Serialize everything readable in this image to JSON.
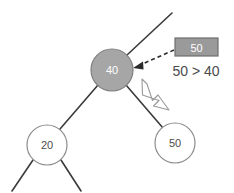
{
  "diagram": {
    "background_color": "#ffffff",
    "edge_color": "#3a3a3a",
    "node_stroke_color": "#8c8c8c",
    "highlight_fill": "#a6a6a6",
    "plain_fill": "#ffffff",
    "box_fill": "#9a9a9a",
    "box_stroke": "#6e6e6e",
    "text_dark": "#4d4d4d",
    "text_light": "#ffffff"
  },
  "nodes": [
    {
      "id": "root-current",
      "label": "40",
      "cx": 112,
      "cy": 70,
      "r": 21,
      "fill": "#a6a6a6",
      "stroke": "#7f7f7f",
      "text_color": "#ffffff",
      "state": "highlighted"
    },
    {
      "id": "left-child",
      "label": "20",
      "cx": 47,
      "cy": 145,
      "r": 20,
      "fill": "#ffffff",
      "stroke": "#8c8c8c",
      "text_color": "#4d4d4d",
      "state": "normal"
    },
    {
      "id": "right-child",
      "label": "50",
      "cx": 175,
      "cy": 143,
      "r": 20,
      "fill": "#ffffff",
      "stroke": "#8c8c8c",
      "text_color": "#4d4d4d",
      "state": "normal"
    }
  ],
  "edges": [
    {
      "id": "edge-parent-up",
      "x1": 127,
      "y1": 55,
      "x2": 172,
      "y2": 13
    },
    {
      "id": "edge-to-left-child",
      "x1": 98,
      "y1": 85,
      "x2": 60,
      "y2": 129
    },
    {
      "id": "edge-to-right-child",
      "x1": 126,
      "y1": 85,
      "x2": 163,
      "y2": 128
    },
    {
      "id": "edge-left-grandchild-a",
      "x1": 33,
      "y1": 160,
      "x2": 12,
      "y2": 191
    },
    {
      "id": "edge-left-grandchild-b",
      "x1": 61,
      "y1": 160,
      "x2": 81,
      "y2": 191
    }
  ],
  "insert_box": {
    "id": "insert-value-box",
    "label": "50",
    "x": 175,
    "y": 38,
    "width": 43,
    "height": 18,
    "fill": "#9a9a9a",
    "stroke": "#6e6e6e",
    "text_color": "#ffffff"
  },
  "dashed_arrow": {
    "id": "compare-arrow",
    "x1": 174,
    "y1": 50,
    "x2": 136,
    "y2": 66,
    "style": "dashed",
    "color": "#2b2b2b",
    "dash_pattern": "4,3"
  },
  "block_arrow": {
    "id": "traverse-right-arrow",
    "x1": 142,
    "y1": 82,
    "x2": 169,
    "y2": 109,
    "fill": "#ffffff",
    "stroke": "#8c8c8c",
    "direction": "down-right"
  },
  "annotations": {
    "comparison_text": "50 > 40",
    "comparison_x": 196,
    "comparison_y": 71
  }
}
